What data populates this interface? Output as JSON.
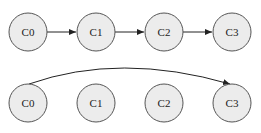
{
  "top_row": {
    "nodes": [
      {
        "label": "C0",
        "cx": 28,
        "cy": 32
      },
      {
        "label": "C1",
        "cx": 96,
        "cy": 32
      },
      {
        "label": "C2",
        "cx": 164,
        "cy": 32
      },
      {
        "label": "C3",
        "cx": 232,
        "cy": 32
      }
    ],
    "edges": [
      {
        "from": "C0",
        "to": "C1"
      },
      {
        "from": "C1",
        "to": "C2"
      },
      {
        "from": "C2",
        "to": "C3"
      }
    ]
  },
  "bottom_row": {
    "nodes": [
      {
        "label": "C0",
        "cx": 28,
        "cy": 103
      },
      {
        "label": "C1",
        "cx": 96,
        "cy": 103
      },
      {
        "label": "C2",
        "cx": 164,
        "cy": 103
      },
      {
        "label": "C3",
        "cx": 232,
        "cy": 103
      }
    ],
    "edges": [
      {
        "from": "C0",
        "to": "C3",
        "style": "arc"
      }
    ]
  },
  "colors": {
    "node_fill": "#ececec",
    "node_stroke": "#555555",
    "edge": "#222222"
  }
}
